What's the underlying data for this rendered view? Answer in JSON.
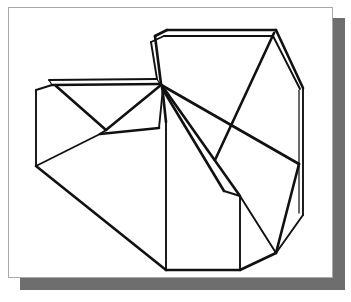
{
  "canvas": {
    "width": 351,
    "height": 302,
    "background_color": "#ffffff"
  },
  "card": {
    "name": "white-drawing-card",
    "x": 8,
    "y": 7,
    "width": 325,
    "height": 271,
    "fill_color": "#ffffff",
    "border_color": "#a8a8a8"
  },
  "shadow": {
    "name": "card-drop-shadow",
    "x": 20,
    "y": 18,
    "width": 325,
    "height": 272,
    "color": "#6e6e6e"
  },
  "figure": {
    "title": "",
    "stroke_color": "#111111",
    "fill_color": "none",
    "vertices": {
      "left_top": [
        36,
        90
      ],
      "left_bottom": [
        36,
        166
      ],
      "ridge_left_back": [
        52,
        85
      ],
      "ridge_right": [
        162,
        84
      ],
      "ridge_right_back": [
        158,
        79
      ],
      "v_notch": [
        106,
        130
      ],
      "mid_shelf_left": [
        105,
        136
      ],
      "mid_shelf_right": [
        158,
        128
      ],
      "peak_left": [
        155,
        35
      ],
      "peak_left_back": [
        150,
        42
      ],
      "eave_left": [
        166,
        30
      ],
      "eave_right": [
        276,
        30
      ],
      "eave_right_back": [
        272,
        36
      ],
      "gable_right": [
        303,
        88
      ],
      "right_vert_top": [
        303,
        88
      ],
      "right_vert_bot": [
        303,
        215
      ],
      "right_low_corner": [
        276,
        253
      ],
      "center_notch": [
        240,
        196
      ],
      "center_vert_bot": [
        240,
        270
      ],
      "bottom_left": [
        166,
        270
      ],
      "front_ridge_top": [
        162,
        84
      ],
      "front_vert_top": [
        166,
        122
      ],
      "ridge_cap_left": [
        166,
        36
      ],
      "fan_mid": [
        215,
        160
      ],
      "fan_low": [
        236,
        190
      ]
    },
    "edges": [
      "left-silhouette-vertical",
      "upper-back-ridge-double-line",
      "left-roof-slope",
      "v-notch-left-fold",
      "v-notch-right-fold",
      "mid-shelf-horizontal",
      "peak-left-gable",
      "top-eave-double-line",
      "right-gable-slope",
      "right-silhouette-vertical",
      "right-lower-bevel",
      "bottom-front-edge",
      "center-front-vertical",
      "fan-edge-upper",
      "fan-edge-middle",
      "fan-edge-lower",
      "left-front-diagonal"
    ]
  }
}
